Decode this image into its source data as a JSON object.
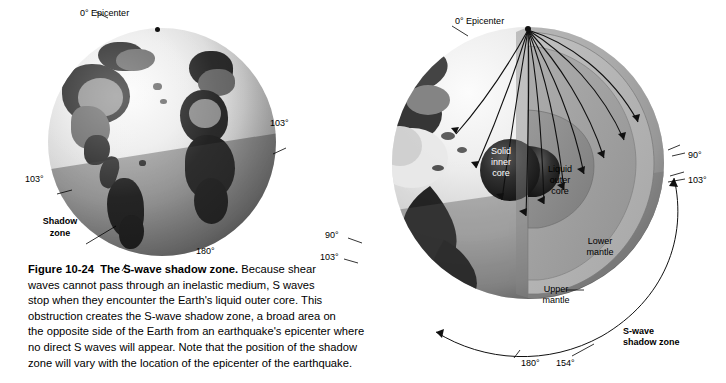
{
  "figure": {
    "number": "Figure 10-24",
    "title": "The S-wave shadow zone.",
    "caption_lines": [
      "Because shear",
      "waves cannot pass through an inelastic medium, S waves",
      "stop when they encounter the Earth's liquid outer core. This",
      "obstruction creates the S-wave shadow zone, a broad area on",
      "the opposite side of the Earth from an earthquake's epicenter where",
      "no direct S waves will appear. Note that the position of the shadow",
      "zone will vary with the location of the epicenter of the earthquake."
    ]
  },
  "left_globe": {
    "name": "surface-view-globe",
    "epicenter_label": "0° Epicenter",
    "angle_right": "103°",
    "angle_left": "103°",
    "angle_bottom": "180°",
    "shadow_label_line1": "Shadow",
    "shadow_label_line2": "zone"
  },
  "right_globe": {
    "name": "cutaway-cross-section",
    "epicenter_label": "0° Epicenter",
    "angle_right_90": "90°",
    "angle_right_103": "103°",
    "angle_left_90": "90°",
    "angle_left_103": "103°",
    "angle_bottom_180": "180°",
    "angle_bottom_154": "154°",
    "shadow_label_line1": "S-wave",
    "shadow_label_line2": "shadow zone",
    "layers": [
      {
        "id": "inner-core",
        "line1": "Solid",
        "line2": "inner",
        "line3": "core"
      },
      {
        "id": "outer-core",
        "line1": "Liquid",
        "line2": "outer",
        "line3": "core"
      },
      {
        "id": "lower-mantle",
        "line1": "Lower",
        "line2": "mantle"
      },
      {
        "id": "upper-mantle",
        "line1": "Upper",
        "line2": "mantle"
      }
    ]
  },
  "colors": {
    "inner_core": "#2e2e2e",
    "outer_core": "#8a8a8a",
    "lower_mantle": "#9f9f9f",
    "upper_mantle": "#b4b4b4",
    "crust": "#6f6f6f",
    "text": "#000000"
  }
}
